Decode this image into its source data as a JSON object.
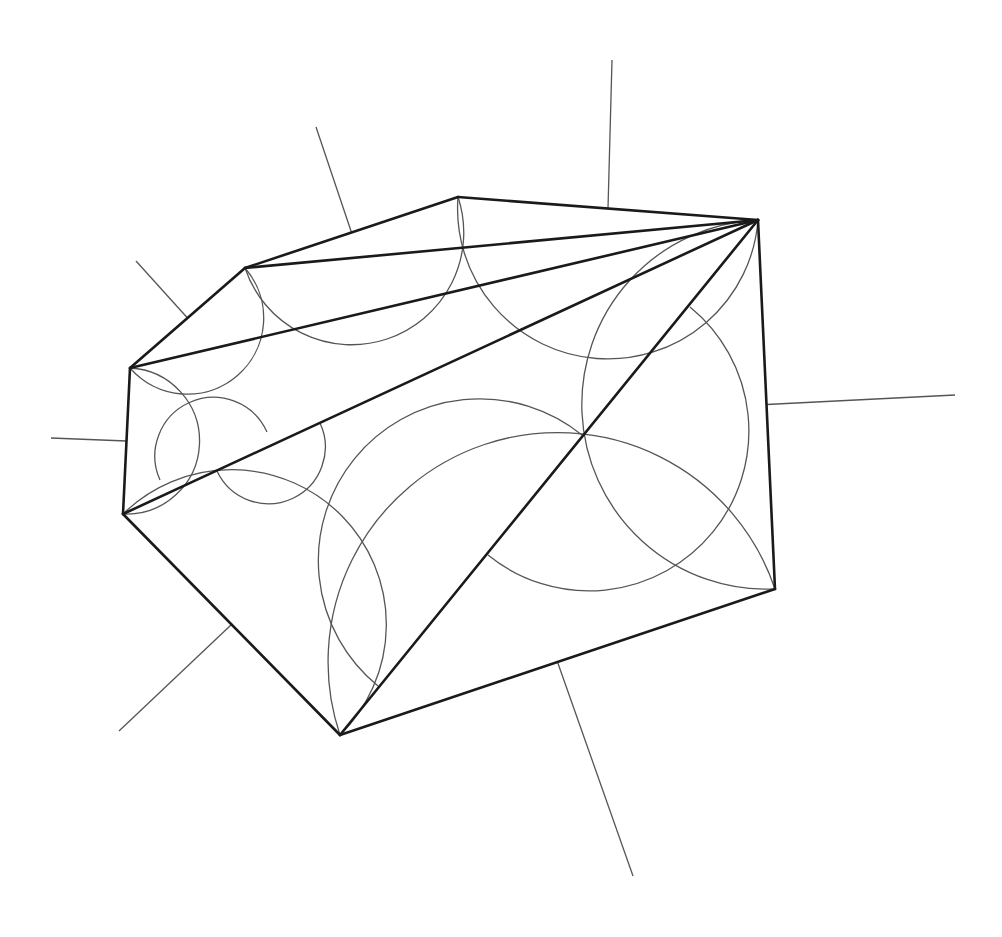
{
  "diagram": {
    "title": "",
    "colors": {
      "edge": "#1a1a1a",
      "arc": "#555555",
      "background": "#ffffff"
    },
    "vertices": {
      "A": [
        758,
        220
      ],
      "B": [
        458,
        197
      ],
      "C": [
        245,
        268
      ],
      "D": [
        130,
        368
      ],
      "E": [
        123,
        514
      ],
      "F": [
        340,
        735
      ],
      "G": [
        775,
        589
      ]
    },
    "polygon_edges": [
      [
        "A",
        "B"
      ],
      [
        "B",
        "C"
      ],
      [
        "C",
        "D"
      ],
      [
        "D",
        "E"
      ],
      [
        "E",
        "F"
      ],
      [
        "F",
        "G"
      ],
      [
        "G",
        "A"
      ]
    ],
    "diagonals": [
      [
        "A",
        "C"
      ],
      [
        "A",
        "D"
      ],
      [
        "A",
        "E"
      ],
      [
        "A",
        "F"
      ]
    ],
    "outer_semicircles": [
      {
        "edge": [
          "A",
          "B"
        ],
        "radius_end": [
          612,
          60
        ]
      },
      {
        "edge": [
          "B",
          "C"
        ],
        "radius_end": [
          316,
          127
        ]
      },
      {
        "edge": [
          "C",
          "D"
        ],
        "radius_end": [
          136,
          261
        ]
      },
      {
        "edge": [
          "D",
          "E"
        ],
        "radius_end": [
          51,
          438
        ]
      },
      {
        "edge": [
          "E",
          "F"
        ],
        "radius_end": [
          119,
          731
        ]
      },
      {
        "edge": [
          "F",
          "G"
        ],
        "radius_end": [
          633,
          876
        ]
      },
      {
        "edge": [
          "G",
          "A"
        ],
        "radius_end": [
          955,
          395
        ]
      }
    ],
    "inner_semicircles": [
      {
        "on": "A-F",
        "from": [
          690,
          307
        ],
        "to": [
          488,
          555
        ],
        "bulge": "right"
      },
      {
        "on": "A-F",
        "from": [
          582,
          435
        ],
        "to": [
          378,
          686
        ],
        "bulge": "left"
      },
      {
        "on": "A-E",
        "from": [
          160,
          480
        ],
        "to": [
          267,
          432
        ],
        "bulge": "up"
      },
      {
        "on": "A-E",
        "from": [
          217,
          471
        ],
        "to": [
          320,
          423
        ],
        "bulge": "down"
      }
    ]
  }
}
